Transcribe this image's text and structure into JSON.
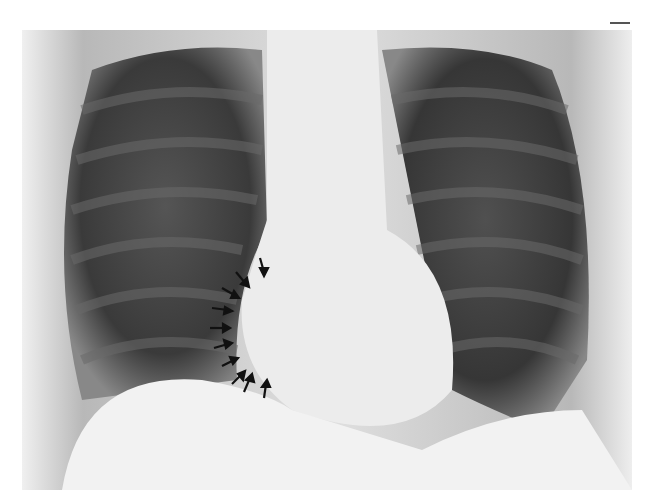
{
  "image": {
    "subject": "chest radiograph (PA view)",
    "annotation": "black arrows marking right heart border",
    "arrow_count": 11,
    "colors": {
      "background": "#ffffff",
      "lung": "#3a3a3a",
      "soft_tissue": "#e8e8e8",
      "arrow": "#111111"
    }
  }
}
